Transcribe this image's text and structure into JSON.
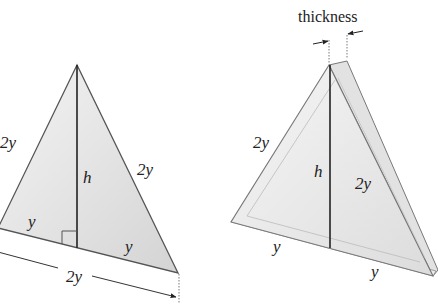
{
  "diagram": {
    "left_figure": {
      "description": "Isosceles triangle cross-section with altitude",
      "labels": {
        "left_side": "2y",
        "right_side": "2y",
        "height": "h",
        "base_left_half": "y",
        "base_right_half": "y",
        "base_dimension": "2y"
      }
    },
    "right_figure": {
      "description": "Triangular plate with thickness",
      "labels": {
        "thickness": "thickness",
        "left_side": "2y",
        "right_side": "2y",
        "height": "h",
        "base_left_half": "y",
        "base_right_half": "y"
      }
    },
    "colors": {
      "stroke": "#555555",
      "altitude": "#222222",
      "fill_light": "#eeeeee",
      "fill_dark": "#d8d8d8"
    }
  }
}
